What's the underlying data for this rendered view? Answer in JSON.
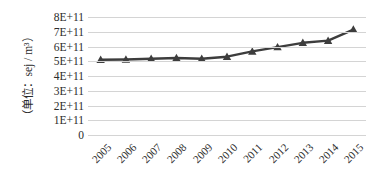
{
  "chart_data": {
    "type": "line",
    "title": "",
    "subtitle": "",
    "xlabel": "",
    "ylabel": "（单位：sej / m³）",
    "categories": [
      "2005",
      "2006",
      "2007",
      "2008",
      "2009",
      "2010",
      "2011",
      "2012",
      "2013",
      "2014",
      "2015"
    ],
    "series": [
      {
        "name": "",
        "values": [
          510000000000,
          512000000000,
          517000000000,
          522000000000,
          517000000000,
          531000000000,
          567000000000,
          596000000000,
          625000000000,
          640000000000,
          715000000000
        ]
      }
    ],
    "ylim": [
      0,
      800000000000
    ],
    "ytick_values": [
      0,
      100000000000,
      200000000000,
      300000000000,
      400000000000,
      500000000000,
      600000000000,
      700000000000,
      800000000000
    ],
    "ytick_labels": [
      "0",
      "1E+11",
      "2E+11",
      "3E+11",
      "4E+11",
      "5E+11",
      "6E+11",
      "7E+11",
      "8E+11"
    ],
    "grid": true,
    "grid_axis": "y",
    "legend": false,
    "legend_position": "none",
    "marker": "triangle",
    "line_color": "#3d3d3d",
    "marker_color": "#3d3d3d",
    "grid_color": "#d4d4d4",
    "background_color": "#ffffff",
    "xtick_rotation": -45
  }
}
